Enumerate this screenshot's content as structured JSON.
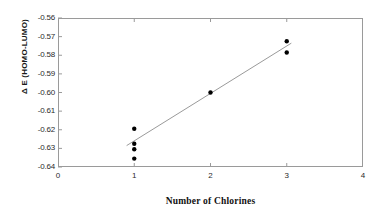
{
  "chart_data": {
    "type": "scatter",
    "title": "",
    "xlabel": "Number of Chlorines",
    "ylabel": "Δ E  (HOMO-LUMO)",
    "xlim": [
      0,
      4
    ],
    "ylim": [
      -0.64,
      -0.56
    ],
    "grid": false,
    "legend": "none",
    "x_ticks": [
      "0",
      "1",
      "2",
      "3",
      "4"
    ],
    "x_tick_values": [
      0,
      1,
      2,
      3,
      4
    ],
    "y_ticks": [
      "-0.64",
      "-0.63",
      "-0.62",
      "-0.61",
      "-0.60",
      "-0.59",
      "-0.58",
      "-0.57",
      "-0.56"
    ],
    "y_tick_values": [
      -0.64,
      -0.63,
      -0.62,
      -0.61,
      -0.6,
      -0.59,
      -0.58,
      -0.57,
      -0.56
    ],
    "series": [
      {
        "name": "data points",
        "marker": "circle",
        "color": "#000000",
        "points": [
          {
            "x": 1,
            "y": -0.6195
          },
          {
            "x": 1,
            "y": -0.6275
          },
          {
            "x": 1,
            "y": -0.6305
          },
          {
            "x": 1,
            "y": -0.6355
          },
          {
            "x": 2,
            "y": -0.6
          },
          {
            "x": 3,
            "y": -0.5725
          },
          {
            "x": 3,
            "y": -0.5785
          }
        ]
      },
      {
        "name": "trendline",
        "marker": "line",
        "color": "#9a9a9a",
        "points": [
          {
            "x": 0.9,
            "y": -0.6285
          },
          {
            "x": 3.06,
            "y": -0.5735
          }
        ]
      }
    ]
  },
  "axes": {
    "y_title": "Δ E  (HOMO-LUMO)",
    "x_title": "Number of Chlorines"
  }
}
